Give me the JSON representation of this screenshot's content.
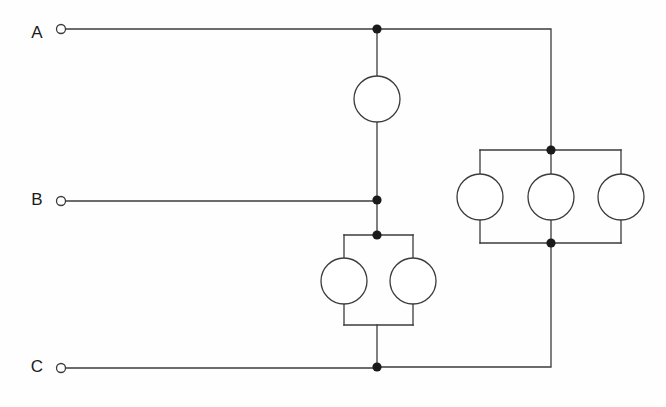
{
  "diagram": {
    "type": "electrical-circuit-schematic",
    "background_color": "#fefefe",
    "wire_color": "#3b3b3b",
    "node_color": "#1a1a1a",
    "element_fill": "#ffffff",
    "canvas": {
      "width": 666,
      "height": 407
    }
  },
  "terminals": [
    {
      "id": "A",
      "label": "A",
      "label_x": 37,
      "label_y": 34,
      "ring_x": 61,
      "ring_y": 34,
      "ring_r": 4.5,
      "wire_y": 34
    },
    {
      "id": "B",
      "label": "B",
      "label_x": 37,
      "label_y": 201,
      "ring_x": 61,
      "ring_y": 201,
      "ring_r": 4.5,
      "wire_y": 201
    },
    {
      "id": "C",
      "label": "C",
      "label_x": 37,
      "label_y": 368,
      "ring_x": 61,
      "ring_y": 368,
      "ring_r": 4.5,
      "wire_y": 368
    }
  ],
  "elements": [
    {
      "id": "E1",
      "group": "single-top",
      "cx": 377,
      "cy": 99,
      "r": 23
    },
    {
      "id": "E2",
      "group": "pair-lower-left",
      "cx": 344,
      "cy": 281,
      "r": 23
    },
    {
      "id": "E3",
      "group": "pair-lower-right",
      "cx": 413,
      "cy": 281,
      "r": 23
    },
    {
      "id": "E4",
      "group": "triple-right-left",
      "cx": 480,
      "cy": 197,
      "r": 23
    },
    {
      "id": "E5",
      "group": "triple-right-middle",
      "cx": 551,
      "cy": 197,
      "r": 23
    },
    {
      "id": "E6",
      "group": "triple-right-right",
      "cx": 621,
      "cy": 197,
      "r": 23
    }
  ],
  "nodes": [
    {
      "id": "N-A-center",
      "x": 377,
      "y": 29,
      "r": 4.6
    },
    {
      "id": "N-B-center",
      "x": 377,
      "y": 200,
      "r": 4.6
    },
    {
      "id": "N-pair-top",
      "x": 377,
      "y": 235,
      "r": 4.6
    },
    {
      "id": "N-C-center",
      "x": 377,
      "y": 367,
      "r": 4.6
    },
    {
      "id": "N-triple-top",
      "x": 551,
      "y": 150,
      "r": 4.6
    },
    {
      "id": "N-triple-bottom",
      "x": 551,
      "y": 243,
      "r": 4.6
    }
  ],
  "wires": [
    {
      "id": "W-A-lead",
      "d": "M 66 29 L 377 29"
    },
    {
      "id": "W-A-to-right-rail",
      "d": "M 377 29 L 551 29 L 551 150"
    },
    {
      "id": "W-top-element-upper",
      "d": "M 377 29 L 377 76"
    },
    {
      "id": "W-top-element-lower",
      "d": "M 377 122 L 377 200"
    },
    {
      "id": "W-B-lead",
      "d": "M 66 201 L 377 201"
    },
    {
      "id": "W-B-to-pair",
      "d": "M 377 200 L 377 235"
    },
    {
      "id": "W-pair-top-rail",
      "d": "M 344 235 L 413 235"
    },
    {
      "id": "W-pair-left-upper",
      "d": "M 344 235 L 344 258"
    },
    {
      "id": "W-pair-right-upper",
      "d": "M 413 235 L 413 258"
    },
    {
      "id": "W-pair-left-lower",
      "d": "M 344 304 L 344 325"
    },
    {
      "id": "W-pair-right-lower",
      "d": "M 413 304 L 413 325"
    },
    {
      "id": "W-pair-bottom-rail",
      "d": "M 344 325 L 413 325"
    },
    {
      "id": "W-pair-to-C",
      "d": "M 377 325 L 377 367"
    },
    {
      "id": "W-C-lead",
      "d": "M 66 368 L 377 368"
    },
    {
      "id": "W-C-to-right-rail",
      "d": "M 377 367 L 551 367 L 551 243"
    },
    {
      "id": "W-triple-top-rail",
      "d": "M 480 150 L 621 150"
    },
    {
      "id": "W-triple-bottom-rail",
      "d": "M 480 243 L 621 243"
    },
    {
      "id": "W-triple-left-upper",
      "d": "M 480 150 L 480 174"
    },
    {
      "id": "W-triple-mid-upper",
      "d": "M 551 150 L 551 174"
    },
    {
      "id": "W-triple-right-upper",
      "d": "M 621 150 L 621 174"
    },
    {
      "id": "W-triple-left-lower",
      "d": "M 480 220 L 480 243"
    },
    {
      "id": "W-triple-mid-lower",
      "d": "M 551 220 L 551 243"
    },
    {
      "id": "W-triple-right-lower",
      "d": "M 621 220 L 621 243"
    }
  ]
}
